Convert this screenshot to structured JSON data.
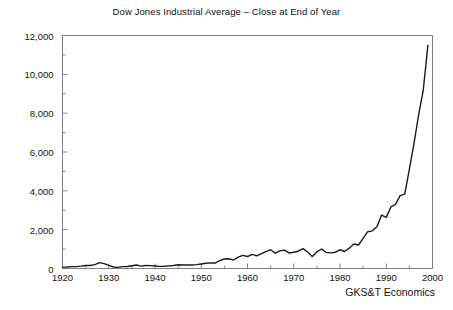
{
  "chart_data": {
    "type": "line",
    "title": "Dow Jones Industrial Average – Close at End of Year",
    "xlabel": "",
    "ylabel": "",
    "xlim": [
      1920,
      2000
    ],
    "ylim": [
      0,
      12000
    ],
    "grid": false,
    "legend": null,
    "annotations": [
      {
        "name": "credit",
        "text": "GKS&T Economics"
      }
    ],
    "ytick_labels": [
      "0",
      "2,000",
      "4,000",
      "6,000",
      "8,000",
      "10,000",
      "12,000"
    ],
    "ytick_values": [
      0,
      2000,
      4000,
      6000,
      8000,
      10000,
      12000
    ],
    "yminor_step": 1000,
    "xtick_labels": [
      "1920",
      "1930",
      "1940",
      "1950",
      "1960",
      "1970",
      "1980",
      "1990",
      "2000"
    ],
    "xtick_values": [
      1920,
      1930,
      1940,
      1950,
      1960,
      1970,
      1980,
      1990,
      2000
    ],
    "xminor_step": 5,
    "line_color": "#1a1a1a",
    "line_width": 1.4,
    "frame_color": "#808080",
    "x": [
      1920,
      1921,
      1922,
      1923,
      1924,
      1925,
      1926,
      1927,
      1928,
      1929,
      1930,
      1931,
      1932,
      1933,
      1934,
      1935,
      1936,
      1937,
      1938,
      1939,
      1940,
      1941,
      1942,
      1943,
      1944,
      1945,
      1946,
      1947,
      1948,
      1949,
      1950,
      1951,
      1952,
      1953,
      1954,
      1955,
      1956,
      1957,
      1958,
      1959,
      1960,
      1961,
      1962,
      1963,
      1964,
      1965,
      1966,
      1967,
      1968,
      1969,
      1970,
      1971,
      1972,
      1973,
      1974,
      1975,
      1976,
      1977,
      1978,
      1979,
      1980,
      1981,
      1982,
      1983,
      1984,
      1985,
      1986,
      1987,
      1988,
      1989,
      1990,
      1991,
      1992,
      1993,
      1994,
      1995,
      1996,
      1997,
      1998,
      1999
    ],
    "values": [
      72,
      81,
      99,
      95,
      120,
      156,
      157,
      202,
      300,
      248,
      164,
      77,
      60,
      99,
      104,
      144,
      180,
      121,
      155,
      150,
      131,
      111,
      119,
      136,
      152,
      193,
      177,
      181,
      177,
      200,
      235,
      269,
      292,
      281,
      404,
      488,
      499,
      436,
      584,
      679,
      616,
      731,
      652,
      763,
      874,
      969,
      786,
      905,
      944,
      800,
      839,
      890,
      1020,
      851,
      616,
      852,
      1005,
      831,
      805,
      839,
      964,
      875,
      1047,
      1259,
      1212,
      1547,
      1896,
      1939,
      2169,
      2753,
      2634,
      3169,
      3301,
      3754,
      3834,
      5117,
      6448,
      7908,
      9181,
      11497
    ]
  }
}
